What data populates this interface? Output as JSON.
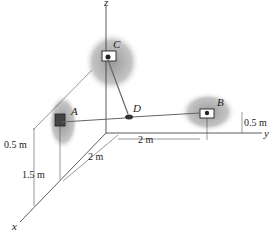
{
  "diagram": {
    "axes": {
      "x": "x",
      "y": "y",
      "z": "z"
    },
    "points": {
      "A": "A",
      "B": "B",
      "C": "C",
      "D": "D"
    },
    "dimensions": {
      "a_height_above_wall": "0.5 m",
      "a_height_lower": "1.5 m",
      "x_offset": "2 m",
      "y_offset": "2 m",
      "b_height": "0.5 m"
    },
    "colors": {
      "line": "#333333",
      "wall": "#8a8a8a",
      "cable": "#666666"
    }
  }
}
